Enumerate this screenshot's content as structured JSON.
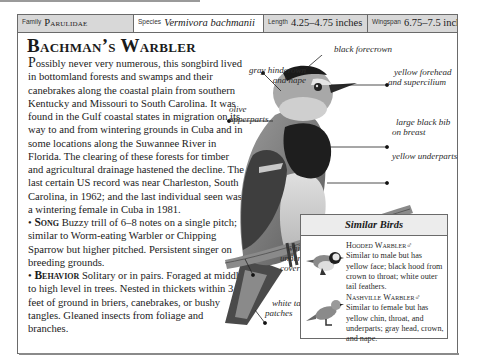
{
  "header": {
    "family": {
      "label": "Family",
      "value": "Parulidae"
    },
    "species": {
      "label": "Species",
      "value": "Vermivora bachmanii"
    },
    "length": {
      "label": "Length",
      "value": "4.25–4.75 inches"
    },
    "wingspan": {
      "label": "Wingspan",
      "value": "6.75–7.5 inches"
    }
  },
  "title": "Bachman’s Warbler",
  "description": {
    "dropcap": "P",
    "text": "ossibly never very numerous, this songbird lived in bottomland forests and swamps and their canebrakes along the coastal plain from southern Kentucky and Missouri to South Carolina. It was found in the Gulf coastal states in migration on its way to and from wintering grounds in Cuba and in some locations along the Suwannee River in Florida. The clearing of these forests for timber and agricultural drainage hastened the decline. The last certain US record was near Charleston, South Carolina, in 1962; and the last individual seen was a wintering female in Cuba in 1981."
  },
  "sections": [
    {
      "bullet": "•",
      "heading": "Song",
      "text": "Buzzy trill of 6–8 notes on a single pitch; similar to Worm-eating Warbler or Chipping Sparrow but higher pitched. Persistent singer on breeding grounds."
    },
    {
      "bullet": "•",
      "heading": "Behavior",
      "text": "Solitary or in pairs. Foraged at middle to high level in trees. Nested in thickets within 3 feet of ground in briers, canebrakes, or bushy tangles. Gleaned insects from foliage and branches."
    }
  ],
  "illustration_labels": {
    "black_forecrown": "black forecrown",
    "gray_hindcrown_1": "gray hindcrown",
    "gray_hindcrown_2": "and nape",
    "yellow_forehead_1": "yellow forehead",
    "yellow_forehead_2": "and supercilium",
    "olive_1": "olive",
    "olive_2": "upperparts",
    "bib_1": "large black bib",
    "bib_2": "on breast",
    "underparts": "yellow underparts",
    "undertail_1": "white",
    "undertail_2": "undertail",
    "undertail_3": "coverts",
    "tail_1": "white tail",
    "tail_2": "patches"
  },
  "similar_birds": {
    "title": "Similar Birds",
    "entries": [
      {
        "name": "Hooded Warbler",
        "sex": "♂",
        "text": "Similar to male but has yellow face; black hood from crown to throat; white outer tail feathers."
      },
      {
        "name": "Nashville Warbler",
        "sex": "♂",
        "text": "Similar to female but has yellow chin, throat, and underparts; gray head, crown, and nape."
      }
    ]
  }
}
